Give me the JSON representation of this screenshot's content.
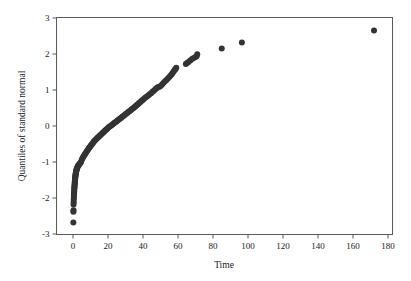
{
  "chart_data": {
    "type": "scatter",
    "title": "",
    "xlabel": "Time",
    "ylabel": "Quantiles of standard normal",
    "xlim": [
      -10,
      185
    ],
    "ylim": [
      -3,
      3
    ],
    "grid": false,
    "legend": null,
    "xticks": [
      0,
      20,
      40,
      60,
      80,
      100,
      120,
      140,
      160,
      180
    ],
    "xticklabels": [
      "0",
      "20",
      "40",
      "60",
      "80",
      "100",
      "120",
      "140",
      "160",
      "180"
    ],
    "yticks": [
      -3,
      -2,
      -1,
      0,
      1,
      2,
      3
    ],
    "yticklabels": [
      "-3",
      "-2",
      "-1",
      "0",
      "1",
      "2",
      "3"
    ],
    "marker": "filled-circle",
    "marker_color": "#333333",
    "marker_size": 3.0,
    "series": [
      {
        "name": "Normal Q-Q",
        "x": [
          0.2,
          0.2,
          0.3,
          0.3,
          0.4,
          0.4,
          0.5,
          0.5,
          0.6,
          0.6,
          0.7,
          0.7,
          0.8,
          0.8,
          0.9,
          0.9,
          1.0,
          1.0,
          1.1,
          1.1,
          1.2,
          1.2,
          1.3,
          1.3,
          1.4,
          1.5,
          1.5,
          1.6,
          1.7,
          1.8,
          1.9,
          2.0,
          2.1,
          2.2,
          2.4,
          2.6,
          2.8,
          3.0,
          3.3,
          3.6,
          3.9,
          4.2,
          4.6,
          5.0,
          5.4,
          5.8,
          6.2,
          6.6,
          7.0,
          7.4,
          7.8,
          8.2,
          8.6,
          9.0,
          9.4,
          9.8,
          10.2,
          10.6,
          11.0,
          11.4,
          11.8,
          12.2,
          12.7,
          13.2,
          13.7,
          14.2,
          14.7,
          15.2,
          15.7,
          16.2,
          16.7,
          17.2,
          17.7,
          18.2,
          18.7,
          19.2,
          19.7,
          20.2,
          20.8,
          21.4,
          22.0,
          22.6,
          23.2,
          23.8,
          24.4,
          25.0,
          25.6,
          26.2,
          26.8,
          27.4,
          28.0,
          28.6,
          29.2,
          29.8,
          30.4,
          31.0,
          31.6,
          32.2,
          32.8,
          33.4,
          34.0,
          34.6,
          35.2,
          35.8,
          36.4,
          37.0,
          37.6,
          38.2,
          38.8,
          39.4,
          40.0,
          40.6,
          41.4,
          42.2,
          43.0,
          43.8,
          44.6,
          45.4,
          46.2,
          47.0,
          47.8,
          48.6,
          49.4,
          50.2,
          51.0,
          51.8,
          52.6,
          53.4,
          54.2,
          55.0,
          55.8,
          56.4,
          57.0,
          57.6,
          58.2,
          58.6,
          59.0,
          64.5,
          65.2,
          66.0,
          67.0,
          68.0,
          69.0,
          70.0,
          70.6,
          71.0,
          85.0,
          96.5,
          172.0
        ],
        "y": [
          -2.68,
          -2.38,
          -2.34,
          -2.18,
          -2.12,
          -2.05,
          -1.99,
          -1.94,
          -1.89,
          -1.85,
          -1.81,
          -1.77,
          -1.73,
          -1.7,
          -1.66,
          -1.63,
          -1.6,
          -1.57,
          -1.54,
          -1.51,
          -1.48,
          -1.46,
          -1.43,
          -1.41,
          -1.38,
          -1.36,
          -1.33,
          -1.31,
          -1.29,
          -1.26,
          -1.24,
          -1.22,
          -1.2,
          -1.18,
          -1.16,
          -1.14,
          -1.12,
          -1.1,
          -1.08,
          -1.06,
          -1.04,
          -1.02,
          -1.0,
          -0.94,
          -0.9,
          -0.86,
          -0.83,
          -0.8,
          -0.77,
          -0.74,
          -0.71,
          -0.68,
          -0.65,
          -0.62,
          -0.6,
          -0.57,
          -0.54,
          -0.52,
          -0.49,
          -0.47,
          -0.44,
          -0.42,
          -0.39,
          -0.37,
          -0.34,
          -0.32,
          -0.3,
          -0.27,
          -0.25,
          -0.23,
          -0.2,
          -0.18,
          -0.16,
          -0.13,
          -0.11,
          -0.09,
          -0.07,
          -0.04,
          -0.02,
          0.0,
          0.02,
          0.04,
          0.07,
          0.09,
          0.11,
          0.13,
          0.16,
          0.18,
          0.2,
          0.22,
          0.25,
          0.27,
          0.29,
          0.32,
          0.34,
          0.36,
          0.39,
          0.41,
          0.43,
          0.46,
          0.48,
          0.5,
          0.53,
          0.55,
          0.58,
          0.6,
          0.63,
          0.65,
          0.68,
          0.71,
          0.73,
          0.76,
          0.79,
          0.82,
          0.85,
          0.88,
          0.91,
          0.95,
          0.98,
          1.02,
          1.05,
          1.08,
          1.09,
          1.12,
          1.16,
          1.2,
          1.24,
          1.28,
          1.32,
          1.36,
          1.4,
          1.44,
          1.48,
          1.52,
          1.56,
          1.58,
          1.62,
          1.72,
          1.75,
          1.78,
          1.82,
          1.86,
          1.89,
          1.92,
          1.94,
          1.99,
          2.15,
          2.32,
          2.65
        ]
      }
    ]
  }
}
